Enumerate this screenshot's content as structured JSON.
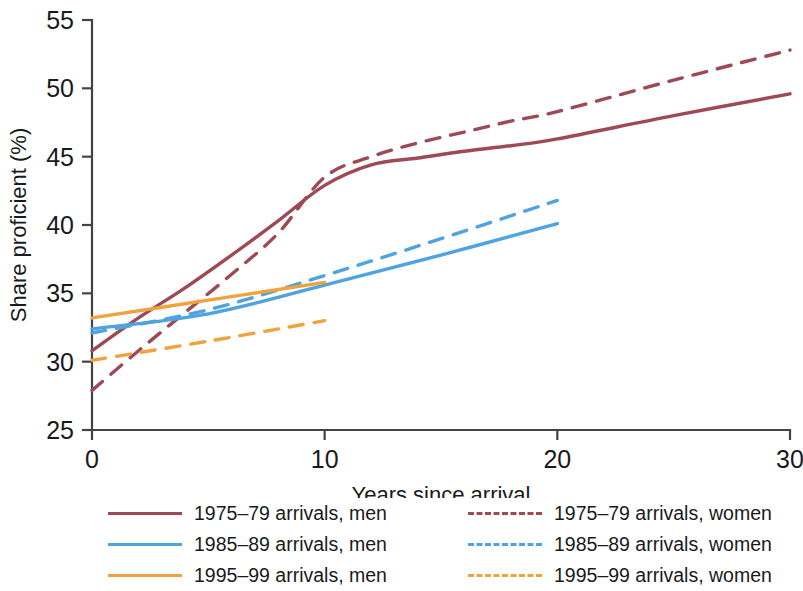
{
  "chart_data": {
    "type": "line",
    "title": "",
    "xlabel": "Years since arrival",
    "ylabel": "Share proficient (%)",
    "xlim": [
      0,
      30
    ],
    "ylim": [
      25,
      55
    ],
    "xticks": [
      0,
      10,
      20,
      30
    ],
    "yticks": [
      25,
      30,
      35,
      40,
      45,
      50,
      55
    ],
    "xtick_labels": [
      "0",
      "10",
      "20",
      "30"
    ],
    "ytick_labels": [
      "25",
      "30",
      "35",
      "40",
      "45",
      "50",
      "55"
    ],
    "grid": false,
    "legend_position": "bottom",
    "colors": {
      "red": "#9e4a55",
      "blue": "#4ea3e0",
      "orange": "#f0a23c"
    },
    "series": [
      {
        "name": "1975–79 arrivals, men",
        "color": "#9e4a55",
        "style": "solid",
        "x": [
          0,
          2,
          4,
          6,
          8,
          10,
          12,
          14,
          16,
          18,
          20,
          25,
          30
        ],
        "values": [
          30.8,
          33.2,
          35.4,
          37.8,
          40.3,
          42.9,
          44.4,
          44.9,
          45.4,
          45.8,
          46.3,
          48.0,
          49.6
        ]
      },
      {
        "name": "1975–79 arrivals, women",
        "color": "#9e4a55",
        "style": "dashed",
        "x": [
          0,
          2,
          4,
          6,
          8,
          10,
          12,
          14,
          16,
          18,
          20,
          25,
          30
        ],
        "values": [
          27.9,
          30.8,
          33.6,
          36.4,
          39.4,
          43.5,
          45.0,
          46.0,
          46.8,
          47.6,
          48.3,
          50.6,
          52.8
        ]
      },
      {
        "name": "1985–89 arrivals, men",
        "color": "#4ea3e0",
        "style": "solid",
        "x": [
          0,
          5,
          10,
          15,
          20
        ],
        "values": [
          32.4,
          33.5,
          35.6,
          37.8,
          40.1
        ]
      },
      {
        "name": "1985–89 arrivals, women",
        "color": "#4ea3e0",
        "style": "dashed",
        "x": [
          0,
          5,
          10,
          15,
          20
        ],
        "values": [
          32.1,
          33.8,
          36.3,
          39.0,
          41.8
        ]
      },
      {
        "name": "1995–99 arrivals, men",
        "color": "#f0a23c",
        "style": "solid",
        "x": [
          0,
          5,
          10
        ],
        "values": [
          33.2,
          34.5,
          35.8
        ]
      },
      {
        "name": "1995–99 arrivals, women",
        "color": "#f0a23c",
        "style": "dashed",
        "x": [
          0,
          5,
          10
        ],
        "values": [
          30.1,
          31.5,
          33.0
        ]
      }
    ]
  },
  "legend": {
    "column_left": [
      {
        "label": "1975–79 arrivals, men",
        "color": "#9e4a55",
        "style": "solid"
      },
      {
        "label": "1985–89 arrivals, men",
        "color": "#4ea3e0",
        "style": "solid"
      },
      {
        "label": "1995–99 arrivals, men",
        "color": "#f0a23c",
        "style": "solid"
      }
    ],
    "column_right": [
      {
        "label": "1975–79 arrivals, women",
        "color": "#9e4a55",
        "style": "dashed"
      },
      {
        "label": "1985–89 arrivals, women",
        "color": "#4ea3e0",
        "style": "dashed"
      },
      {
        "label": "1995–99 arrivals, women",
        "color": "#f0a23c",
        "style": "dashed"
      }
    ]
  }
}
